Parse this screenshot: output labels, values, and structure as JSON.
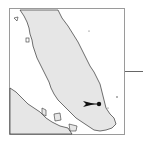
{
  "map": {
    "region": "Malay Peninsula",
    "colors": {
      "land": "#e6e6e6",
      "sea": "#ffffff",
      "coastline": "#333333",
      "frame": "#9a9a9a",
      "marker": "#111111"
    },
    "marker": {
      "type": "dot-with-arrow",
      "x": 99,
      "y": 104
    },
    "arrow": {
      "direction": "right",
      "x1": 83,
      "x2": 95,
      "y": 104
    },
    "leader_line": {
      "x1": 125,
      "x2": 143,
      "y": 71
    }
  }
}
